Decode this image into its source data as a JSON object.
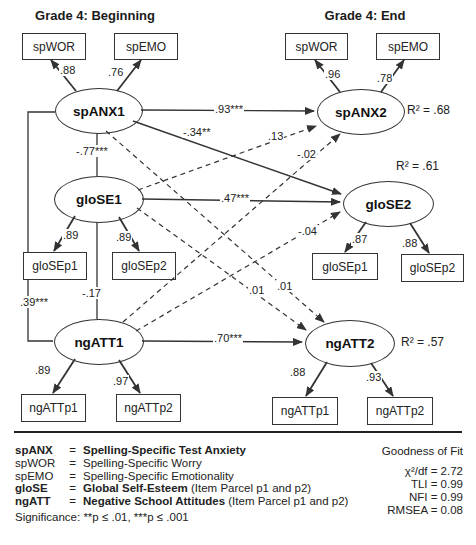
{
  "headers": {
    "left": "Grade 4: Beginning",
    "right": "Grade 4: End"
  },
  "nodes": {
    "spANX1": "spANX1",
    "gloSE1": "gloSE1",
    "ngATT1": "ngATT1",
    "spANX2": "spANX2",
    "gloSE2": "gloSE2",
    "ngATT2": "ngATT2"
  },
  "boxes": {
    "spWOR1": "spWOR",
    "spEMO1": "spEMO",
    "spWOR2": "spWOR",
    "spEMO2": "spEMO",
    "gloSEp1L": "gloSEp1",
    "gloSEp2L": "gloSEp2",
    "gloSEp1R": "gloSEp1",
    "gloSEp2R": "gloSEp2",
    "ngATTp1L": "ngATTp1",
    "ngATTp2L": "ngATTp2",
    "ngATTp1R": "ngATTp1",
    "ngATTp2R": "ngATTp2"
  },
  "coef": {
    "load_spWOR1": ".88",
    "load_spEMO1": ".76",
    "load_spWOR2": ".96",
    "load_spEMO2": ".78",
    "load_gloSEp1L": ".89",
    "load_gloSEp2L": ".89",
    "load_gloSEp1R": ".87",
    "load_gloSEp2R": ".88",
    "load_ngATTp1L": ".89",
    "load_ngATTp2L": ".97",
    "load_ngATTp1R": ".88",
    "load_ngATTp2R": ".93",
    "stab_spANX": ".93***",
    "stab_gloSE": ".47***",
    "stab_ngATT": ".70***",
    "cross_spANX1_gloSE2": "-.34**",
    "cross_gloSE1_spANX2": ".13",
    "cross_ngATT1_spANX2": "-.02",
    "cross_ngATT1_gloSE2": "-.04",
    "cross_spANX1_ngATT2": ".01",
    "cross_gloSE1_ngATT2": ".01",
    "corr_spANX1_gloSE1": "-.77***",
    "corr_gloSE1_ngATT1": "-.17",
    "corr_spANX1_ngATT1": ".39***"
  },
  "r2": {
    "spANX2": "R² = .68",
    "gloSE2": "R² = .61",
    "ngATT2": "R² = .57"
  },
  "legend": {
    "eq_sign": "=",
    "rows": [
      {
        "abbr": "spANX",
        "main": "Spelling-Specific Test Anxiety",
        "note": ""
      },
      {
        "abbr": "spWOR",
        "main": "Spelling-Specific Worry",
        "note": ""
      },
      {
        "abbr": "spEMO",
        "main": "Spelling-Specific Emotionality",
        "note": ""
      },
      {
        "abbr": "gloSE",
        "main": "Global Self-Esteem",
        "note": " (Item Parcel p1 and p2)"
      },
      {
        "abbr": "ngATT",
        "main": "Negative School Attitudes",
        "note": " (Item Parcel p1 and p2)"
      }
    ],
    "significance": "Significance: **p ≤ .01, ***p ≤ .001"
  },
  "fit": {
    "title": "Goodness of Fit",
    "chi": "χ²/df = 2.72",
    "tli": "TLI = 0.99",
    "nfi": "NFI = 0.99",
    "rmsea": "RMSEA = 0.08"
  }
}
